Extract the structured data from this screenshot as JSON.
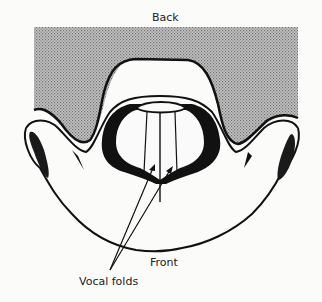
{
  "diagram": {
    "labels": {
      "back": "Back",
      "front": "Front",
      "vocal_folds": "Vocal folds"
    },
    "colors": {
      "background": "#fbfbfa",
      "shaded_region": "#a9a9a9",
      "ink": "#111111"
    }
  }
}
